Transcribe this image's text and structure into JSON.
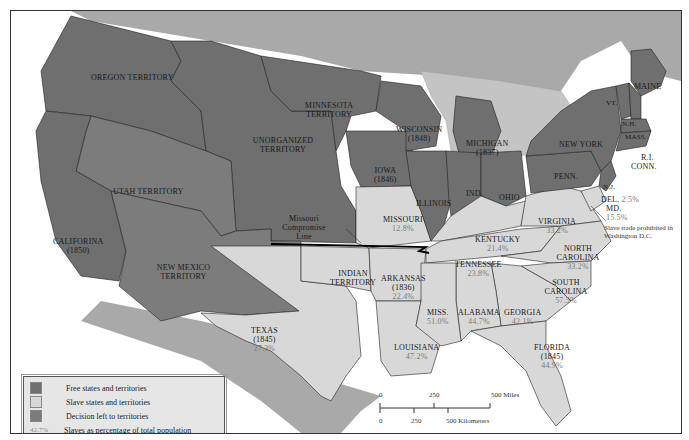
{
  "map": {
    "regions": [
      {
        "name": "OREGON TERRITORY",
        "status": "free"
      },
      {
        "name": "MINNESOTA TERRITORY",
        "status": "free"
      },
      {
        "name": "UNORGANIZED TERRITORY",
        "status": "free"
      },
      {
        "name": "UTAH TERRITORY",
        "status": "decision"
      },
      {
        "name": "NEW MEXICO TERRITORY",
        "status": "decision"
      },
      {
        "name": "CALIFORINA",
        "year": "(1850)",
        "status": "free"
      },
      {
        "name": "WISCONSIN",
        "year": "(1848)",
        "status": "free"
      },
      {
        "name": "MICHIGAN",
        "year": "(1837)",
        "status": "free"
      },
      {
        "name": "IOWA",
        "year": "(1846)",
        "status": "free"
      },
      {
        "name": "ILLINOIS",
        "status": "free"
      },
      {
        "name": "IND.",
        "status": "free"
      },
      {
        "name": "OHIO",
        "status": "free"
      },
      {
        "name": "NEW YORK",
        "status": "free"
      },
      {
        "name": "PENN.",
        "status": "free"
      },
      {
        "name": "MAINE",
        "status": "free"
      },
      {
        "name": "VT.",
        "status": "free"
      },
      {
        "name": "N.H.",
        "status": "free"
      },
      {
        "name": "MASS.",
        "status": "free"
      },
      {
        "name": "R.I.",
        "status": "free"
      },
      {
        "name": "CONN.",
        "status": "free"
      },
      {
        "name": "N.J.",
        "status": "free"
      },
      {
        "name": "MISSOURI",
        "pct": "12.8%",
        "status": "slave"
      },
      {
        "name": "KENTUCKY",
        "pct": "21.4%",
        "status": "slave"
      },
      {
        "name": "VIRGINIA",
        "pct": "33.2%",
        "status": "slave"
      },
      {
        "name": "DEL.",
        "pct": "2.5%",
        "status": "slave"
      },
      {
        "name": "MD.",
        "pct": "15.5%",
        "status": "slave"
      },
      {
        "name": "TENNESSEE",
        "pct": "23.8%",
        "status": "slave"
      },
      {
        "name": "NORTH CAROLINA",
        "pct": "33.2%",
        "status": "slave"
      },
      {
        "name": "SOUTH CAROLINA",
        "pct": "57.5%",
        "status": "slave"
      },
      {
        "name": "ARKANSAS",
        "year": "(1836)",
        "pct": "22.4%",
        "status": "slave"
      },
      {
        "name": "INDIAN TERRITORY",
        "status": "slave"
      },
      {
        "name": "TEXAS",
        "year": "(1845)",
        "pct": "27.3%",
        "status": "slave"
      },
      {
        "name": "LOUISIANA",
        "pct": "47.2%",
        "status": "slave"
      },
      {
        "name": "MISS.",
        "pct": "51.0%",
        "status": "slave"
      },
      {
        "name": "ALABAMA",
        "pct": "44.7%",
        "status": "slave"
      },
      {
        "name": "GEORGIA",
        "pct": "42.1%",
        "status": "slave"
      },
      {
        "name": "FLORIDA",
        "year": "(1845)",
        "pct": "44.9%",
        "status": "slave"
      }
    ],
    "annotations": {
      "missouri_line": "Missouri Compromise Line",
      "dc_note": "Slave trade prohibited in Washington D.C."
    },
    "colors": {
      "free": "#6f6f6f",
      "decision": "#7c7c7c",
      "slave": "#d8d8d8",
      "foreign": "#a9a9a9",
      "water": "#ffffff",
      "pct_text": "#7a7a7a"
    }
  },
  "legend": {
    "items": [
      {
        "label": "Free states and territories",
        "color": "#6f6f6f"
      },
      {
        "label": "Slave states and territories",
        "color": "#d8d8d8"
      },
      {
        "label": "Decision left to territories",
        "color": "#7c7c7c"
      }
    ],
    "pct_key": "42.7%",
    "pct_label": "Slaves as percentage of total population"
  },
  "scale": {
    "miles": [
      "0",
      "250",
      "500 Miles"
    ],
    "km": [
      "0",
      "250",
      "500 Kilometers"
    ]
  }
}
